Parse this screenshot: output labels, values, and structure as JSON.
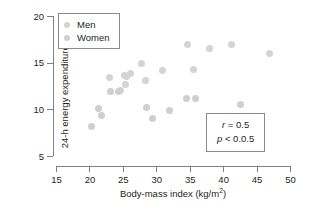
{
  "chart_data": {
    "type": "scatter",
    "title": "",
    "xlabel": "Body-mass index (kg/m2)",
    "ylabel": "24-h energy expenditure (MJ)",
    "xlim": [
      15,
      50
    ],
    "ylim": [
      5,
      20
    ],
    "xticks": [
      15,
      20,
      25,
      30,
      35,
      40,
      45,
      50
    ],
    "yticks": [
      5,
      10,
      15,
      20
    ],
    "grid": false,
    "legend_position": "top-left",
    "marker_color": "#d4d4d4",
    "axis_color": "#808080",
    "series": [
      {
        "name": "Men",
        "marker": "circle",
        "color": "#d4d4d4",
        "points": [
          [
            23.0,
            13.4
          ],
          [
            25.2,
            13.6
          ],
          [
            25.6,
            13.5
          ],
          [
            26.2,
            13.8
          ],
          [
            27.8,
            14.9
          ],
          [
            31.0,
            14.2
          ],
          [
            34.6,
            17.0
          ],
          [
            35.5,
            14.3
          ],
          [
            37.9,
            16.5
          ],
          [
            41.3,
            17.0
          ],
          [
            46.9,
            16.0
          ],
          [
            28.4,
            13.1
          ],
          [
            25.4,
            12.7
          ],
          [
            24.6,
            12.0
          ]
        ]
      },
      {
        "name": "Women",
        "marker": "circle",
        "color": "#cfcfcf",
        "points": [
          [
            20.3,
            8.2
          ],
          [
            21.3,
            10.1
          ],
          [
            21.8,
            9.3
          ],
          [
            23.1,
            11.9
          ],
          [
            24.3,
            11.9
          ],
          [
            28.5,
            10.2
          ],
          [
            29.5,
            9.0
          ],
          [
            32.0,
            9.9
          ],
          [
            34.5,
            11.2
          ],
          [
            35.9,
            11.2
          ],
          [
            42.6,
            10.5
          ]
        ]
      }
    ],
    "annotations": {
      "stats_box": {
        "correlation_symbol": "r",
        "correlation_text": "= 0.5",
        "pvalue_symbol": "p",
        "pvalue_text": "< 0.0.5"
      }
    }
  },
  "legend": {
    "items": [
      {
        "label": "Men"
      },
      {
        "label": "Women"
      }
    ]
  },
  "axes": {
    "x_title_main": "Body-mass index (kg/m",
    "x_title_exponent": "2",
    "x_title_close": ")",
    "y_title": "24-h energy expenditure (MJ)"
  }
}
